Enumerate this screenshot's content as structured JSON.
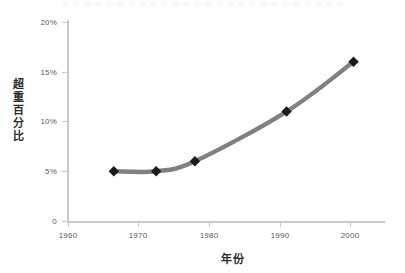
{
  "chart_data": {
    "type": "line",
    "title": "",
    "xlabel": "年份",
    "ylabel": "超重百分比",
    "xlim": [
      1960,
      2005
    ],
    "ylim": [
      0,
      20
    ],
    "grid": false,
    "legend": null,
    "x_ticks": [
      "1960",
      "1970",
      "1980",
      "1990",
      "2000"
    ],
    "x_tick_values": [
      1960,
      1970,
      1980,
      1990,
      2000
    ],
    "y_ticks": [
      "0",
      "5%",
      "10%",
      "15%",
      "20%"
    ],
    "y_tick_values": [
      0,
      5,
      10,
      15,
      20
    ],
    "series": [
      {
        "name": "超重百分比",
        "marker": "diamond",
        "color": "#808080",
        "marker_color": "#1a1a1a",
        "x": [
          1966.5,
          1972.5,
          1978,
          1991,
          2000.5
        ],
        "values": [
          5,
          5,
          6,
          11,
          16
        ],
        "points": [
          {
            "x": 1966.5,
            "y": 5
          },
          {
            "x": 1972.5,
            "y": 5
          },
          {
            "x": 1978,
            "y": 6
          },
          {
            "x": 1991,
            "y": 11
          },
          {
            "x": 2000.5,
            "y": 16
          }
        ]
      }
    ]
  },
  "axis": {
    "line_color": "#c9c9c9",
    "tick_label_color": "#595959",
    "title_color": "#2b2b2b"
  },
  "labels": {
    "y_0": "0",
    "y_5": "5%",
    "y_10": "10%",
    "y_15": "15%",
    "y_20": "20%",
    "x_1960": "1960",
    "x_1970": "1970",
    "x_1980": "1980",
    "x_1990": "1990",
    "x_2000": "2000",
    "y_axis_title": "超重百分比",
    "x_axis_title": "年份"
  }
}
